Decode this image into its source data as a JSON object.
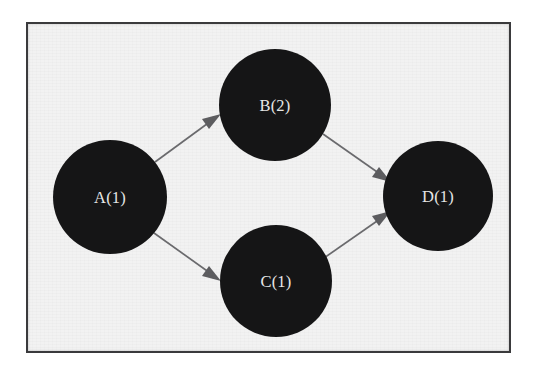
{
  "figure": {
    "type": "node-link-diagram",
    "frame": {
      "border_color": "#3a3a3c",
      "background_color": "#f2f2f2",
      "page_color": "#ffffff"
    },
    "style": {
      "node_fill": "#151516",
      "node_label_color": "#e9e9e9",
      "edge_color": "#6b6b6e",
      "arrowhead_color": "#5d5d60"
    }
  },
  "nodes": [
    {
      "id": "A",
      "label": "A(1)",
      "cx": 82,
      "cy": 173,
      "r": 57
    },
    {
      "id": "B",
      "label": "B(2)",
      "cx": 247,
      "cy": 81,
      "r": 56
    },
    {
      "id": "C",
      "label": "C(1)",
      "cx": 248,
      "cy": 257,
      "r": 56
    },
    {
      "id": "D",
      "label": "D(1)",
      "cx": 410,
      "cy": 172,
      "r": 55
    }
  ],
  "edges": [
    {
      "id": "A-B",
      "from": "A",
      "to": "B",
      "directed": true
    },
    {
      "id": "A-C",
      "from": "A",
      "to": "C",
      "directed": true
    },
    {
      "id": "B-D",
      "from": "B",
      "to": "D",
      "directed": true
    },
    {
      "id": "C-D",
      "from": "C",
      "to": "D",
      "directed": true
    }
  ]
}
